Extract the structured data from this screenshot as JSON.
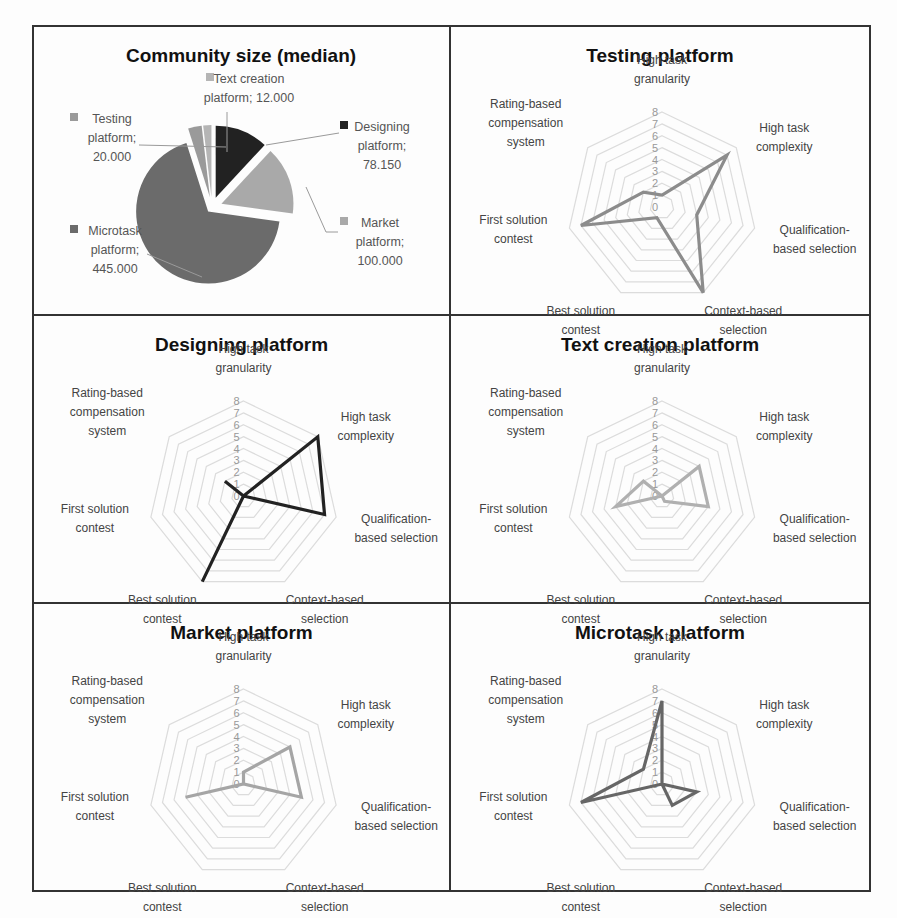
{
  "chart_data": [
    {
      "type": "pie",
      "title": "Community size (median)",
      "exploded": true,
      "categories": [
        "Designing platform",
        "Market platform",
        "Microtask platform",
        "Testing platform",
        "Text creation platform"
      ],
      "values": [
        78150,
        100000,
        445000,
        20000,
        12000
      ],
      "labels": [
        "Designing platform; 78.150",
        "Market platform; 100.000",
        "Microtask platform; 445.000",
        "Testing platform; 20.000",
        "Text creation platform; 12.000"
      ],
      "colors": [
        "#222222",
        "#a9a9a9",
        "#6b6b6b",
        "#9a9a9a",
        "#b5b5b5"
      ],
      "legend_position": "data labels with leader lines"
    },
    {
      "type": "radar",
      "title": "Testing platform",
      "axes": [
        "High task granularity",
        "High task complexity",
        "Qualification-based selection",
        "Context-based selection",
        "Best solution contest",
        "First solution contest",
        "Rating-based compensation system"
      ],
      "values": [
        1,
        7,
        3,
        8,
        1,
        7,
        2
      ],
      "rlim": [
        0,
        8
      ],
      "ticks": [
        0,
        1,
        2,
        3,
        4,
        5,
        6,
        7,
        8
      ],
      "color": "#8c8c8c"
    },
    {
      "type": "radar",
      "title": "Designing platform",
      "axes": [
        "High task granularity",
        "High task complexity",
        "Qualification-based selection",
        "Context-based selection",
        "Best solution contest",
        "First solution contest",
        "Rating-based compensation system"
      ],
      "values": [
        0,
        8,
        7,
        0,
        8,
        0,
        2
      ],
      "rlim": [
        0,
        8
      ],
      "ticks": [
        0,
        1,
        2,
        3,
        4,
        5,
        6,
        7,
        8
      ],
      "color": "#222222"
    },
    {
      "type": "radar",
      "title": "Text creation platform",
      "axes": [
        "High task granularity",
        "High task complexity",
        "Qualification-based selection",
        "Context-based selection",
        "Best solution contest",
        "First solution contest",
        "Rating-based compensation system"
      ],
      "values": [
        0,
        4,
        4,
        0.5,
        0,
        4,
        2
      ],
      "rlim": [
        0,
        8
      ],
      "ticks": [
        0,
        1,
        2,
        3,
        4,
        5,
        6,
        7,
        8
      ],
      "color": "#b0b0b0"
    },
    {
      "type": "radar",
      "title": "Market platform",
      "axes": [
        "High task granularity",
        "High task complexity",
        "Qualification-based selection",
        "Context-based selection",
        "Best solution contest",
        "First solution contest",
        "Rating-based compensation system"
      ],
      "values": [
        1,
        5,
        5,
        0,
        0,
        5,
        0
      ],
      "rlim": [
        0,
        8
      ],
      "ticks": [
        0,
        1,
        2,
        3,
        4,
        5,
        6,
        7,
        8
      ],
      "color": "#a5a5a5"
    },
    {
      "type": "radar",
      "title": "Microtask platform",
      "axes": [
        "High task granularity",
        "High task complexity",
        "Qualification-based selection",
        "Context-based selection",
        "Best solution contest",
        "First solution contest",
        "Rating-based compensation system"
      ],
      "values": [
        7,
        0,
        3,
        2,
        0,
        7,
        2
      ],
      "rlim": [
        0,
        8
      ],
      "ticks": [
        0,
        1,
        2,
        3,
        4,
        5,
        6,
        7,
        8
      ],
      "color": "#666666"
    }
  ],
  "axis_label_lines": [
    [
      "High task",
      "granularity"
    ],
    [
      "High task",
      "complexity"
    ],
    [
      "Qualification-",
      "based selection"
    ],
    [
      "Context-based",
      "selection"
    ],
    [
      "Best solution",
      "contest"
    ],
    [
      "First solution",
      "contest"
    ],
    [
      "Rating-based",
      "compensation",
      "system"
    ]
  ],
  "pie_label_lines": [
    [
      "Designing",
      "platform;",
      "78.150"
    ],
    [
      "Market",
      "platform;",
      "100.000"
    ],
    [
      "Microtask",
      "platform;",
      "445.000"
    ],
    [
      "Testing",
      "platform;",
      "20.000"
    ],
    [
      "Text creation",
      "platform; 12.000"
    ]
  ]
}
